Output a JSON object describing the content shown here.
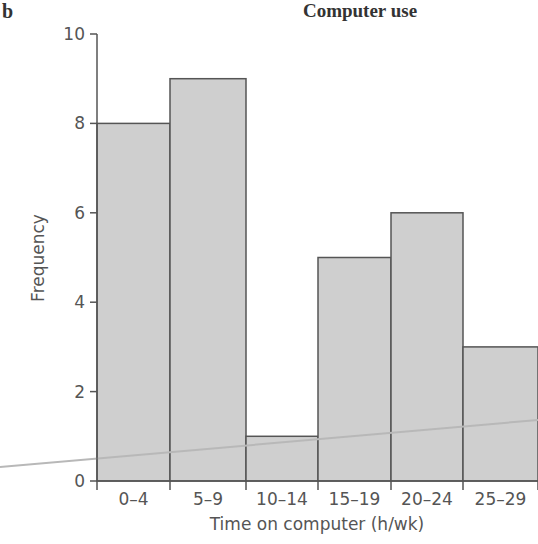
{
  "panel_label": "b",
  "chart_data": {
    "type": "bar",
    "title": "Computer use",
    "xlabel": "Time on computer (h/wk)",
    "ylabel": "Frequency",
    "categories": [
      "0–4",
      "5–9",
      "10–14",
      "15–19",
      "20–24",
      "25–29"
    ],
    "values": [
      8,
      9,
      1,
      5,
      6,
      3
    ],
    "ylim": [
      0,
      10
    ],
    "yticks": [
      0,
      2,
      4,
      6,
      8,
      10
    ],
    "grid": false,
    "legend": null,
    "bar_color": "#cfcfcf",
    "edge_color": "#555555"
  }
}
